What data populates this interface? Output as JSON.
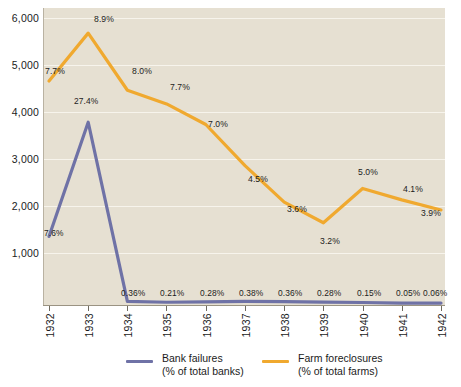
{
  "chart_data": {
    "type": "line",
    "title": "",
    "xlabel": "",
    "ylabel": "",
    "categories": [
      "1932",
      "1933",
      "1934",
      "1935",
      "1936",
      "1937",
      "1938",
      "1939",
      "1940",
      "1941",
      "1942"
    ],
    "ylim": [
      0,
      6500
    ],
    "yticks": [
      1000,
      2000,
      3000,
      4000,
      5000,
      6000
    ],
    "ytick_labels": [
      "1,000",
      "2,000",
      "3,000",
      "4,000",
      "5,000",
      "6,000"
    ],
    "grid": true,
    "legend_position": "bottom",
    "series": [
      {
        "name": "Bank failures",
        "sublabel": "(% of total banks)",
        "color": "#6f72a6",
        "values": [
          1500,
          4000,
          80,
          60,
          70,
          80,
          75,
          65,
          55,
          40,
          42
        ],
        "point_labels": [
          "7.6%",
          "27.4%",
          "0.36%",
          "0.21%",
          "0.28%",
          "0.38%",
          "0.36%",
          "0.28%",
          "0.15%",
          "0.05%",
          "0.06%"
        ]
      },
      {
        "name": "Farm foreclosures",
        "sublabel": "(% of total farms)",
        "color": "#f0a92f",
        "values": [
          4900,
          5950,
          4700,
          4400,
          3950,
          3050,
          2250,
          1800,
          2550,
          2300,
          2080
        ],
        "point_labels": [
          "7.7%",
          "8.9%",
          "8.0%",
          "7.7%",
          "7.0%",
          "4.5%",
          "3.6%",
          "3.2%",
          "5.0%",
          "4.1%",
          "3.9%"
        ]
      }
    ],
    "colors": {
      "plot_background": "#e6e0d2",
      "gridline": "#f7f4ec",
      "axis": "#9a9382",
      "text": "#1b1b1b",
      "bank_failures": "#6f72a6",
      "farm_foreclosures": "#f0a92f"
    }
  },
  "legend": {
    "items": [
      {
        "name": "Bank failures",
        "sublabel": "(% of total banks)"
      },
      {
        "name": "Farm foreclosures",
        "sublabel": "(% of total farms)"
      }
    ]
  }
}
